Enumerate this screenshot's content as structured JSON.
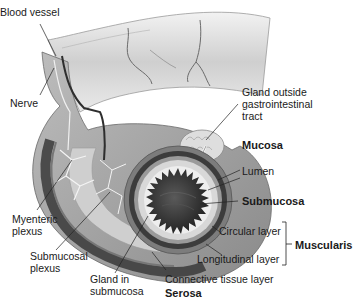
{
  "diagram": {
    "colors": {
      "background": "#ffffff",
      "tissue_light": "#d9d9d9",
      "tissue_mid": "#a8a8a8",
      "tissue_dark": "#3a3a3a",
      "lumen": "#2b2b2b",
      "leader_line": "#222222",
      "text": "#1a1a1a"
    },
    "labels": {
      "blood_vessel": "Blood vessel",
      "nerve": "Nerve",
      "gland_outside": [
        "Gland outside",
        "gastrointestinal",
        "tract"
      ],
      "mucosa": "Mucosa",
      "lumen": "Lumen",
      "submucosa": "Submucosa",
      "circular_layer": "Circular layer",
      "longitudinal_layer": "Longitudinal layer",
      "muscularis": "Muscularis",
      "myenteric_plexus": [
        "Myenteric",
        "plexus"
      ],
      "submucosal_plexus": [
        "Submucosal",
        "plexus"
      ],
      "gland_in_submucosa": [
        "Gland in",
        "submucosa"
      ],
      "connective_tissue_layer": "Connective tissue layer",
      "serosa": "Serosa"
    }
  }
}
